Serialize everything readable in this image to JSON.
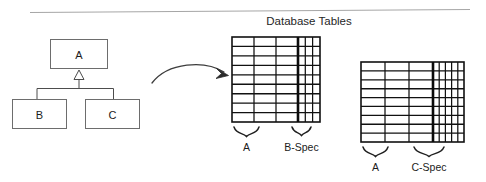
{
  "figure": {
    "title": "Database Tables",
    "divider": {
      "visible": true
    }
  },
  "uml": {
    "classes": [
      {
        "id": "a",
        "label": "A",
        "role": "superclass"
      },
      {
        "id": "b",
        "label": "B",
        "role": "subclass"
      },
      {
        "id": "c",
        "label": "C",
        "role": "subclass"
      }
    ],
    "relationship": "generalization"
  },
  "arrow": {
    "name": "maps-to-arrow",
    "direction": "right"
  },
  "tables": [
    {
      "id": "table-b",
      "rows": 9,
      "segments": [
        {
          "id": "a-cols-1",
          "label": "A",
          "columns": 3,
          "width_class": "wide"
        },
        {
          "id": "b-spec-cols",
          "label": "B-Spec",
          "columns": 3,
          "width_class": "narrow"
        }
      ]
    },
    {
      "id": "table-c",
      "rows": 9,
      "segments": [
        {
          "id": "a-cols-2",
          "label": "A",
          "columns": 3,
          "width_class": "wide"
        },
        {
          "id": "c-spec-cols",
          "label": "C-Spec",
          "columns": 5,
          "width_class": "narrow"
        }
      ]
    }
  ],
  "colors": {
    "stroke": "#3a3a3a",
    "table_stroke": "#111111",
    "divider": "#9a9a9a",
    "text": "#1c1c1c",
    "background": "#ffffff"
  }
}
